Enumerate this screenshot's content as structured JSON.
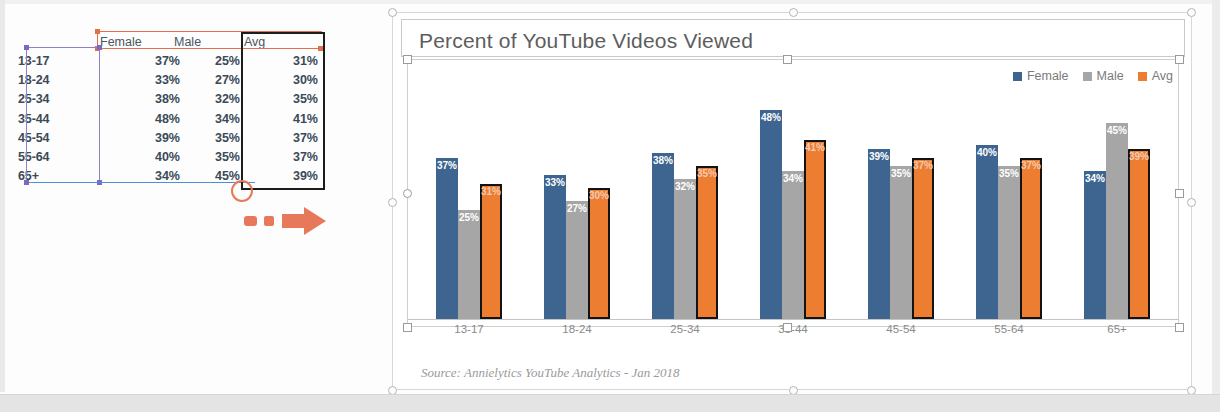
{
  "table": {
    "headers": [
      "",
      "Female",
      "Male",
      "Avg"
    ],
    "rows": [
      {
        "age": "13-17",
        "female": "37%",
        "male": "25%",
        "avg": "31%"
      },
      {
        "age": "18-24",
        "female": "33%",
        "male": "27%",
        "avg": "30%"
      },
      {
        "age": "25-34",
        "female": "38%",
        "male": "32%",
        "avg": "35%"
      },
      {
        "age": "35-44",
        "female": "48%",
        "male": "34%",
        "avg": "41%"
      },
      {
        "age": "45-54",
        "female": "39%",
        "male": "35%",
        "avg": "37%"
      },
      {
        "age": "55-64",
        "female": "40%",
        "male": "35%",
        "avg": "37%"
      },
      {
        "age": "65+",
        "female": "34%",
        "male": "45%",
        "avg": "39%"
      }
    ],
    "annotations": {
      "arrow": "dashed-arrow-right",
      "circle": "circle-highlight",
      "header_selection_color": "#e2714a",
      "category_selection_color": "#7b69bd",
      "value_selection_color": "#4d8fd6",
      "avg_column_box_color": "#1c1c1c"
    }
  },
  "chart": {
    "title": "Percent of YouTube Videos Viewed",
    "source": "Source: Annielytics YouTube Analytics - Jan 2018",
    "legend": [
      {
        "label": "Female",
        "color": "#3d6590"
      },
      {
        "label": "Male",
        "color": "#a6a6a6"
      },
      {
        "label": "Avg",
        "color": "#ed7d31"
      }
    ],
    "selected": true
  },
  "chart_data": {
    "type": "bar",
    "title": "Percent of YouTube Videos Viewed",
    "xlabel": "",
    "ylabel": "",
    "ylim": [
      0,
      50
    ],
    "grid": false,
    "legend_position": "top-right",
    "annotation": "Source: Annielytics YouTube Analytics - Jan 2018",
    "categories": [
      "13-17",
      "18-24",
      "25-34",
      "35-44",
      "45-54",
      "55-64",
      "65+"
    ],
    "series": [
      {
        "name": "Female",
        "color": "#3d6590",
        "values": [
          37,
          33,
          38,
          48,
          39,
          40,
          34
        ],
        "labels": [
          "37%",
          "33%",
          "38%",
          "48%",
          "39%",
          "40%",
          "34%"
        ]
      },
      {
        "name": "Male",
        "color": "#a6a6a6",
        "values": [
          25,
          27,
          32,
          34,
          35,
          35,
          45
        ],
        "labels": [
          "25%",
          "27%",
          "32%",
          "34%",
          "35%",
          "35%",
          "45%"
        ]
      },
      {
        "name": "Avg",
        "color": "#ed7d31",
        "outline": "#131313",
        "values": [
          31,
          30,
          35,
          41,
          37,
          37,
          39
        ],
        "labels": [
          "31%",
          "30%",
          "35%",
          "41%",
          "37%",
          "37%",
          "39%"
        ]
      }
    ]
  }
}
